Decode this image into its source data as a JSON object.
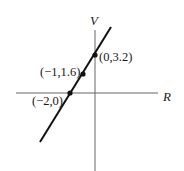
{
  "diagram": {
    "type": "line-graph",
    "axes": {
      "x_label": "R",
      "y_label": "V"
    },
    "points": [
      {
        "label": "(0,3.2)",
        "x": 0,
        "y": 3.2
      },
      {
        "label": "(−1,1.6)",
        "x": -1,
        "y": 1.6
      },
      {
        "label": "(−2,0)",
        "x": -2,
        "y": 0
      }
    ],
    "colors": {
      "line": "#111111",
      "axis": "#555555",
      "background": "#ffffff"
    }
  }
}
